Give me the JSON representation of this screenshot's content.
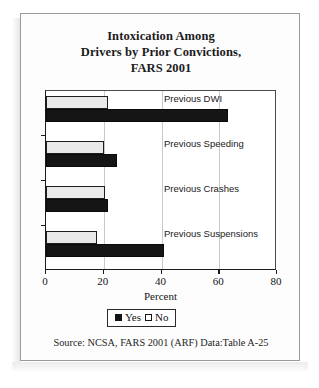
{
  "source_note": "Source: NCSA, FARS 2001 (ARF) Data:Table A-25",
  "title_lines": [
    "Intoxication Among",
    "Drivers by Prior Convictions,",
    "FARS 2001"
  ],
  "legend": {
    "yes_label": "Yes",
    "no_label": "No"
  },
  "colors": {
    "yes": "#151515",
    "no": "#e9e9e9",
    "outline": "#1a1a1a",
    "gridline": "#c9c9c9"
  },
  "chart_data": {
    "type": "bar",
    "orientation": "horizontal",
    "grouped": true,
    "title": "Intoxication Among Drivers by Prior Convictions, FARS 2001",
    "xlabel": "Percent",
    "ylabel": "",
    "xlim": [
      0,
      80
    ],
    "xticks": [
      0,
      20,
      40,
      60,
      80
    ],
    "xtick_labels": [
      "0",
      "20",
      "40",
      "60",
      "80"
    ],
    "grid": "vertical",
    "legend_position": "bottom-center",
    "categories": [
      "Previous DWI",
      "Previous Speeding",
      "Previous Crashes",
      "Previous Suspensions"
    ],
    "series": [
      {
        "name": "No",
        "values": [
          21.5,
          20.0,
          20.5,
          17.5
        ]
      },
      {
        "name": "Yes",
        "values": [
          63.0,
          24.5,
          21.5,
          41.0
        ]
      }
    ]
  }
}
